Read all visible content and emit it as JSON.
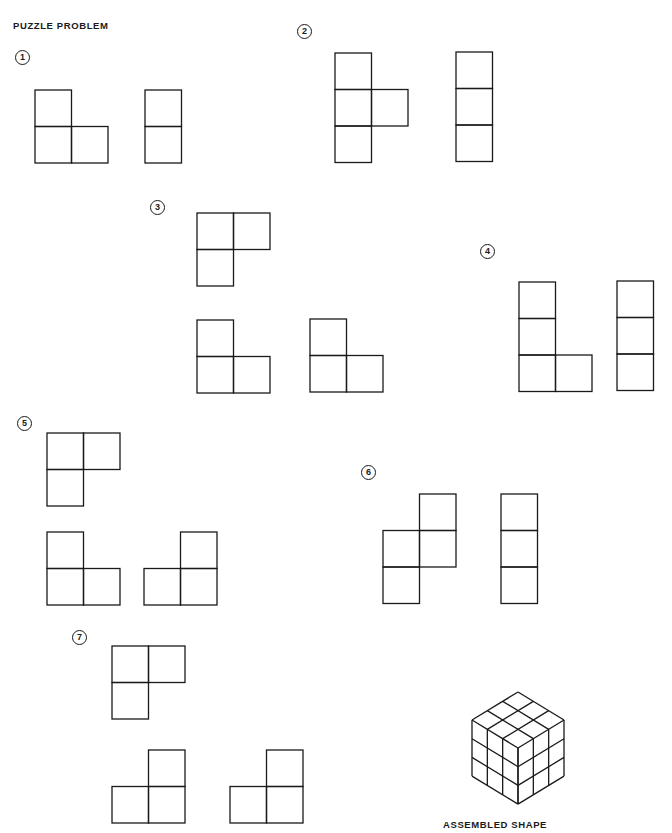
{
  "title": "PUZZLE PROBLEM",
  "caption": "ASSEMBLED SHAPE",
  "colors": {
    "ink": "#1a1a1a",
    "background": "#ffffff"
  },
  "cell_size": 36.5,
  "puzzles": [
    {
      "number": "1",
      "label_pos": [
        15,
        50
      ],
      "pieces": [
        {
          "name": "L-tromino",
          "origin": [
            35,
            90
          ],
          "cells": [
            [
              0,
              0
            ],
            [
              0,
              1
            ],
            [
              1,
              1
            ]
          ]
        },
        {
          "name": "domino",
          "origin": [
            145,
            90
          ],
          "cells": [
            [
              0,
              0
            ],
            [
              0,
              1
            ]
          ]
        }
      ]
    },
    {
      "number": "2",
      "label_pos": [
        297,
        24
      ],
      "pieces": [
        {
          "name": "T-tetromino",
          "origin": [
            335,
            53
          ],
          "cells": [
            [
              0,
              0
            ],
            [
              0,
              1
            ],
            [
              1,
              1
            ],
            [
              0,
              2
            ]
          ]
        },
        {
          "name": "I-tromino",
          "origin": [
            456,
            52
          ],
          "cells": [
            [
              0,
              0
            ],
            [
              0,
              1
            ],
            [
              0,
              2
            ]
          ]
        }
      ]
    },
    {
      "number": "3",
      "label_pos": [
        150,
        200
      ],
      "pieces": [
        {
          "name": "L-tromino",
          "origin": [
            197,
            213
          ],
          "cells": [
            [
              0,
              0
            ],
            [
              1,
              0
            ],
            [
              0,
              1
            ]
          ]
        },
        {
          "name": "L-tromino",
          "origin": [
            197,
            320
          ],
          "cells": [
            [
              0,
              0
            ],
            [
              0,
              1
            ],
            [
              1,
              1
            ]
          ]
        },
        {
          "name": "L-tromino",
          "origin": [
            310,
            319
          ],
          "cells": [
            [
              0,
              0
            ],
            [
              0,
              1
            ],
            [
              1,
              1
            ]
          ]
        }
      ]
    },
    {
      "number": "4",
      "label_pos": [
        480,
        244
      ],
      "pieces": [
        {
          "name": "L-tetromino",
          "origin": [
            519,
            282
          ],
          "cells": [
            [
              0,
              0
            ],
            [
              0,
              1
            ],
            [
              0,
              2
            ],
            [
              1,
              2
            ]
          ]
        },
        {
          "name": "I-tromino",
          "origin": [
            617,
            281
          ],
          "cells": [
            [
              0,
              0
            ],
            [
              0,
              1
            ],
            [
              0,
              2
            ]
          ]
        }
      ]
    },
    {
      "number": "5",
      "label_pos": [
        17,
        416
      ],
      "pieces": [
        {
          "name": "L-tromino",
          "origin": [
            47,
            433
          ],
          "cells": [
            [
              0,
              0
            ],
            [
              1,
              0
            ],
            [
              0,
              1
            ]
          ]
        },
        {
          "name": "L-tromino",
          "origin": [
            47,
            532
          ],
          "cells": [
            [
              0,
              0
            ],
            [
              0,
              1
            ],
            [
              1,
              1
            ]
          ]
        },
        {
          "name": "L-tromino",
          "origin": [
            144,
            532
          ],
          "cells": [
            [
              1,
              0
            ],
            [
              0,
              1
            ],
            [
              1,
              1
            ]
          ]
        }
      ]
    },
    {
      "number": "6",
      "label_pos": [
        361,
        465
      ],
      "pieces": [
        {
          "name": "S-tetromino",
          "origin": [
            383,
            494
          ],
          "cells": [
            [
              1,
              0
            ],
            [
              0,
              1
            ],
            [
              1,
              1
            ],
            [
              0,
              2
            ]
          ]
        },
        {
          "name": "I-tromino",
          "origin": [
            501,
            494
          ],
          "cells": [
            [
              0,
              0
            ],
            [
              0,
              1
            ],
            [
              0,
              2
            ]
          ]
        }
      ]
    },
    {
      "number": "7",
      "label_pos": [
        72,
        630
      ],
      "pieces": [
        {
          "name": "L-tromino",
          "origin": [
            112,
            646
          ],
          "cells": [
            [
              0,
              0
            ],
            [
              1,
              0
            ],
            [
              0,
              1
            ]
          ]
        },
        {
          "name": "L-tromino",
          "origin": [
            112,
            750
          ],
          "cells": [
            [
              1,
              0
            ],
            [
              0,
              1
            ],
            [
              1,
              1
            ]
          ]
        },
        {
          "name": "L-tromino",
          "origin": [
            230,
            750
          ],
          "cells": [
            [
              1,
              0
            ],
            [
              0,
              1
            ],
            [
              1,
              1
            ]
          ]
        }
      ]
    }
  ],
  "assembled_cube": {
    "size": 3,
    "top_vertex": [
      518,
      692
    ],
    "half_width": 46,
    "half_height": 28,
    "layer_height": 18.7
  }
}
